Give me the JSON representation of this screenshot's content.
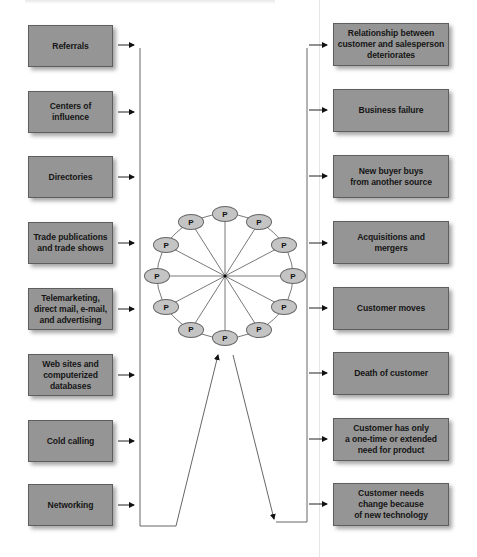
{
  "diagram": {
    "type": "prospecting-wheel",
    "center_label": "",
    "node_label": "P",
    "node_count": 12,
    "sources_of_new_prospects": [
      {
        "label": "Referrals"
      },
      {
        "label": "Centers of\ninfluence"
      },
      {
        "label": "Directories"
      },
      {
        "label": "Trade publications\nand trade shows"
      },
      {
        "label": "Telemarketing,\ndirect mail, e-mail,\nand advertising"
      },
      {
        "label": "Web sites and\ncomputerized\ndatabases"
      },
      {
        "label": "Cold calling"
      },
      {
        "label": "Networking"
      }
    ],
    "reasons_customers_are_lost": [
      {
        "label": "Relationship between\ncustomer and salesperson\ndeteriorates"
      },
      {
        "label": "Business failure"
      },
      {
        "label": "New buyer buys\nfrom another source"
      },
      {
        "label": "Acquisitions and\nmergers"
      },
      {
        "label": "Customer moves"
      },
      {
        "label": "Death of customer"
      },
      {
        "label": "Customer has only\na one-time or extended\nneed  for product"
      },
      {
        "label": "Customer needs\nchange because\nof new technology"
      }
    ],
    "colors": {
      "box_fill": "#959595",
      "box_border": "#5e5e5e",
      "node_fill": "#c4c4c4",
      "line": "#555555",
      "background": "#ffffff"
    }
  }
}
